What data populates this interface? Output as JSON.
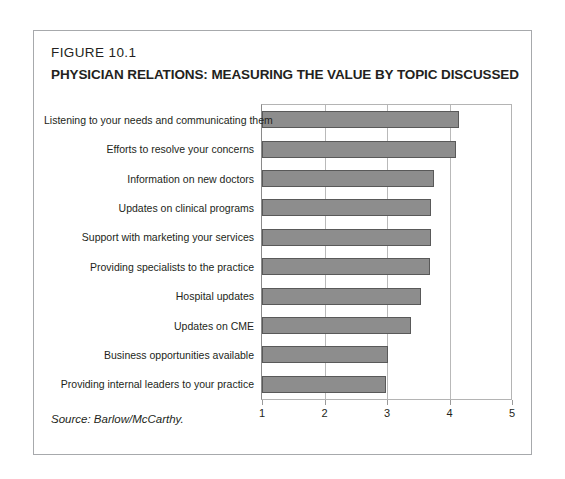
{
  "figure": {
    "number": "FIGURE 10.1",
    "title": "PHYSICIAN RELATIONS: MEASURING THE VALUE BY TOPIC DISCUSSED",
    "source": "Source: Barlow/McCarthy."
  },
  "colors": {
    "bar_fill": "#8d8d8d",
    "bar_border": "#595959",
    "frame": "#a7a9ac",
    "gridline": "#b9b9b9",
    "text": "#231f20"
  },
  "chart_data": {
    "type": "bar",
    "orientation": "horizontal",
    "title": "PHYSICIAN RELATIONS: MEASURING THE VALUE BY TOPIC DISCUSSED",
    "subtitle": "FIGURE 10.1",
    "xlabel": "",
    "ylabel": "",
    "xlim": [
      1,
      5
    ],
    "xticks": [
      1,
      2,
      3,
      4,
      5
    ],
    "xtick_labels": [
      "1",
      "2",
      "3",
      "4",
      "5"
    ],
    "grid": true,
    "grid_axis": "x",
    "legend": false,
    "source": "Source: Barlow/McCarthy.",
    "categories": [
      "Listening to your needs and communicating them",
      "Efforts to resolve your concerns",
      "Information on new doctors",
      "Updates on clinical programs",
      "Support with marketing your services",
      "Providing specialists to the practice",
      "Hospital updates",
      "Updates on CME",
      "Business opportunities available",
      "Providing internal leaders to your practice"
    ],
    "values": [
      4.15,
      4.1,
      3.75,
      3.7,
      3.7,
      3.68,
      3.55,
      3.38,
      3.02,
      2.98
    ]
  }
}
